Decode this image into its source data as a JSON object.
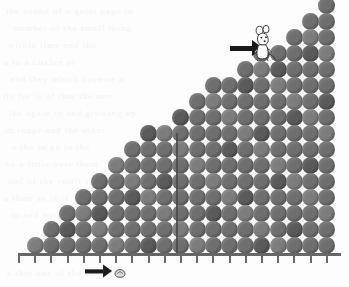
{
  "figure": {
    "background_color": "#fdfdfd",
    "dot_color": "#6f6f6f",
    "dot_color_dark": "#5a5a5a",
    "dot_color_light": "#7d7d7d",
    "axis_color": "#666666",
    "annotation_color": "#1a1a1a",
    "divider_color": "#4a4a4a"
  },
  "annotations": {
    "top_arrow": {
      "name": "arrow-pointing-to-mouse",
      "direction": "right",
      "label": ""
    },
    "bottom_arrow": {
      "name": "arrow-pointing-to-seed",
      "direction": "right",
      "label": ""
    },
    "mouse": {
      "name": "mouse-figure",
      "label": "",
      "description": "small white mouse standing on column top"
    },
    "seed": {
      "name": "seed-figure",
      "label": "",
      "description": "small light seed below axis"
    },
    "divider_line": {
      "name": "vertical-divider",
      "label": ""
    }
  },
  "ghost_text": [
    "the sound of    a quiet page   in",
    "  number      of the small thing",
    "    within       time  and  the",
    "a      to  a        circles   of",
    "and   they       which  became a",
    "its  for  is   of  that  the one",
    "the  again   in  and  growing up",
    "  in     range    and  the other",
    "a   the       to   go  in    the",
    "so     a little      over  them",
    "  and     of the   small   steps",
    "a    their      as    in      it",
    "   to          and          with",
    "a  that    one   of  the    same"
  ],
  "chart_data": {
    "type": "bar",
    "title": "",
    "xlabel": "",
    "ylabel": "",
    "categories": [
      "1",
      "2",
      "3",
      "4",
      "5",
      "6",
      "7",
      "8",
      "9",
      "10",
      "11",
      "12",
      "13",
      "14",
      "15",
      "16",
      "17",
      "18",
      "19"
    ],
    "values": [
      1,
      2,
      3,
      4,
      5,
      6,
      7,
      8,
      8,
      9,
      10,
      11,
      11,
      12,
      13,
      13,
      14,
      15,
      16
    ],
    "unit": "dots per column",
    "ylim": [
      0,
      16
    ],
    "grid": false,
    "legend": false
  }
}
